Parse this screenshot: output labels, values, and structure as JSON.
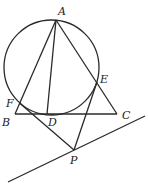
{
  "diagram": {
    "type": "geometry",
    "stroke_color": "#2a2a2a",
    "background": "#ffffff",
    "circle": {
      "cx": 51.5,
      "cy": 67.5,
      "r": 47.5
    },
    "points": {
      "A": {
        "x": 56,
        "y": 20,
        "label": "A",
        "lx": 58,
        "ly": 15
      },
      "B": {
        "x": 15,
        "y": 114,
        "label": "B",
        "lx": 2,
        "ly": 126
      },
      "C": {
        "x": 117,
        "y": 114,
        "label": "C",
        "lx": 122,
        "ly": 119
      },
      "D": {
        "x": 47,
        "y": 114,
        "label": "D",
        "lx": 48,
        "ly": 126
      },
      "E": {
        "x": 97,
        "y": 82,
        "label": "E",
        "lx": 100,
        "ly": 83
      },
      "F": {
        "x": 19.5,
        "y": 103,
        "label": "F",
        "lx": 6,
        "ly": 107
      },
      "P": {
        "x": 74,
        "y": 150,
        "label": "P",
        "lx": 70,
        "ly": 164
      }
    },
    "segments": [
      {
        "name": "segment-AB",
        "from": "A",
        "to": "B"
      },
      {
        "name": "segment-AD",
        "from": "A",
        "to": "D"
      },
      {
        "name": "segment-AC",
        "from": "A",
        "to": "C"
      },
      {
        "name": "segment-BC",
        "from": "B",
        "to": "C"
      },
      {
        "name": "segment-FP",
        "from": "F",
        "to": "P"
      },
      {
        "name": "segment-EP",
        "from": "E",
        "to": "P"
      }
    ],
    "lines": [
      {
        "name": "line-through-P",
        "x1": 8,
        "y1": 182,
        "x2": 145,
        "y2": 116
      }
    ]
  }
}
